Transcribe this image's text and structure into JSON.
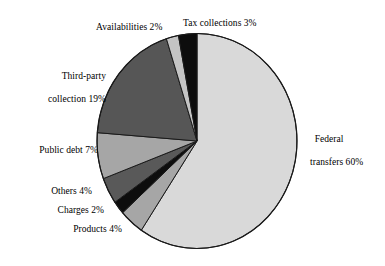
{
  "chart_data": {
    "type": "pie",
    "title": "",
    "subtitle": "",
    "xlabel": "",
    "ylabel": "",
    "legend_position": "none",
    "grid": false,
    "unit": "%",
    "start_angle_deg": 0,
    "direction": "clockwise",
    "categories": [
      "Federal transfers",
      "Products",
      "Charges",
      "Others",
      "Public debt",
      "Third-party collection",
      "Availabilities",
      "Tax collections"
    ],
    "values": [
      60,
      4,
      2,
      4,
      7,
      19,
      2,
      3
    ],
    "slices": [
      {
        "name": "Federal transfers",
        "value": 60,
        "label": "Federal transfers 60%",
        "color": "#d9d9d9"
      },
      {
        "name": "Products",
        "value": 4,
        "label": "Products 4%",
        "color": "#a6a6a6"
      },
      {
        "name": "Charges",
        "value": 2,
        "label": "Charges 2%",
        "color": "#0d0d0d"
      },
      {
        "name": "Others",
        "value": 4,
        "label": "Others 4%",
        "color": "#595959"
      },
      {
        "name": "Public debt",
        "value": 7,
        "label": "Public debt 7%",
        "color": "#a6a6a6"
      },
      {
        "name": "Third-party collection",
        "value": 19,
        "label": "Third-party collection 19%",
        "color": "#565656"
      },
      {
        "name": "Availabilities",
        "value": 2,
        "label": "Availabilities 2%",
        "color": "#c4c4c4"
      },
      {
        "name": "Tax collections",
        "value": 3,
        "label": "Tax collections 3%",
        "color": "#0d0d0d"
      }
    ]
  },
  "labels": {
    "availabilities": "Availabilities 2%",
    "tax_collections": "Tax collections 3%",
    "third_party_line1": "Third-party",
    "third_party_line2": "collection 19%",
    "public_debt": "Public debt 7%",
    "others": "Others 4%",
    "charges": "Charges 2%",
    "products": "Products 4%",
    "federal_line1": "Federal",
    "federal_line2": "transfers 60%"
  },
  "colors": {
    "outline": "#1a1a1a",
    "background": "#ffffff",
    "text": "#000000"
  }
}
